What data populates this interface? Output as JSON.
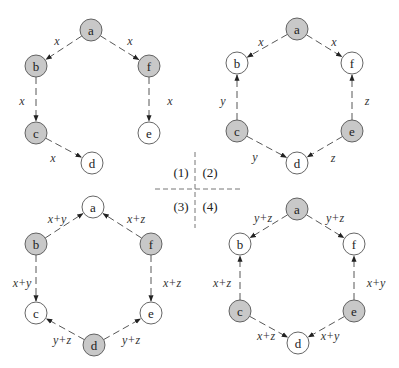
{
  "colors": {
    "shaded_fill": "#c8c8c8",
    "unshaded_fill": "#ffffff",
    "node_stroke": "#555555",
    "edge_stroke": "#444444"
  },
  "divider": {
    "labels": [
      "(1)",
      "(2)",
      "(3)",
      "(4)"
    ]
  },
  "diagrams": [
    {
      "id": "1",
      "nodes": [
        {
          "id": "a",
          "label": "a",
          "x": 91,
          "y": 30,
          "shaded": true
        },
        {
          "id": "b",
          "label": "b",
          "x": 36,
          "y": 66,
          "shaded": true
        },
        {
          "id": "f",
          "label": "f",
          "x": 149,
          "y": 66,
          "shaded": true
        },
        {
          "id": "c",
          "label": "c",
          "x": 36,
          "y": 133,
          "shaded": true
        },
        {
          "id": "e",
          "label": "e",
          "x": 149,
          "y": 133,
          "shaded": false
        },
        {
          "id": "d",
          "label": "d",
          "x": 92,
          "y": 163,
          "shaded": false
        }
      ],
      "edges": [
        {
          "from": "a",
          "to": "b",
          "label": "x",
          "lx": 57,
          "ly": 41
        },
        {
          "from": "a",
          "to": "f",
          "label": "x",
          "lx": 130,
          "ly": 41
        },
        {
          "from": "b",
          "to": "c",
          "label": "x",
          "lx": 22,
          "ly": 101
        },
        {
          "from": "f",
          "to": "e",
          "label": "x",
          "lx": 170,
          "ly": 101
        },
        {
          "from": "c",
          "to": "d",
          "label": "x",
          "lx": 53,
          "ly": 158
        }
      ]
    },
    {
      "id": "2",
      "nodes": [
        {
          "id": "a",
          "label": "a",
          "x": 297,
          "y": 29,
          "shaded": true
        },
        {
          "id": "b",
          "label": "b",
          "x": 237,
          "y": 63,
          "shaded": false
        },
        {
          "id": "f",
          "label": "f",
          "x": 352,
          "y": 63,
          "shaded": false
        },
        {
          "id": "c",
          "label": "c",
          "x": 237,
          "y": 131,
          "shaded": true
        },
        {
          "id": "e",
          "label": "e",
          "x": 352,
          "y": 131,
          "shaded": true
        },
        {
          "id": "d",
          "label": "d",
          "x": 297,
          "y": 163,
          "shaded": false
        }
      ],
      "edges": [
        {
          "from": "a",
          "to": "b",
          "label": "x",
          "lx": 261,
          "ly": 42
        },
        {
          "from": "a",
          "to": "f",
          "label": "x",
          "lx": 334,
          "ly": 42
        },
        {
          "from": "c",
          "to": "b",
          "label": "y",
          "lx": 223,
          "ly": 101
        },
        {
          "from": "e",
          "to": "f",
          "label": "z",
          "lx": 367,
          "ly": 101
        },
        {
          "from": "c",
          "to": "d",
          "label": "y",
          "lx": 255,
          "ly": 157
        },
        {
          "from": "e",
          "to": "d",
          "label": "z",
          "lx": 333,
          "ly": 158
        }
      ]
    },
    {
      "id": "3",
      "nodes": [
        {
          "id": "a",
          "label": "a",
          "x": 93,
          "y": 207,
          "shaded": false
        },
        {
          "id": "b",
          "label": "b",
          "x": 36,
          "y": 244,
          "shaded": true
        },
        {
          "id": "f",
          "label": "f",
          "x": 151,
          "y": 244,
          "shaded": true
        },
        {
          "id": "c",
          "label": "c",
          "x": 36,
          "y": 313,
          "shaded": false
        },
        {
          "id": "e",
          "label": "e",
          "x": 151,
          "y": 313,
          "shaded": false
        },
        {
          "id": "d",
          "label": "d",
          "x": 94,
          "y": 345,
          "shaded": true
        }
      ],
      "edges": [
        {
          "from": "b",
          "to": "a",
          "label": "x+y",
          "lx": 57,
          "ly": 219
        },
        {
          "from": "f",
          "to": "a",
          "label": "x+z",
          "lx": 136,
          "ly": 219
        },
        {
          "from": "b",
          "to": "c",
          "label": "x+y",
          "lx": 22,
          "ly": 283
        },
        {
          "from": "f",
          "to": "e",
          "label": "x+z",
          "lx": 172,
          "ly": 283
        },
        {
          "from": "d",
          "to": "c",
          "label": "y+z",
          "lx": 62,
          "ly": 340
        },
        {
          "from": "d",
          "to": "e",
          "label": "y+z",
          "lx": 131,
          "ly": 340
        }
      ]
    },
    {
      "id": "4",
      "nodes": [
        {
          "id": "a",
          "label": "a",
          "x": 297,
          "y": 209,
          "shaded": true
        },
        {
          "id": "b",
          "label": "b",
          "x": 240,
          "y": 244,
          "shaded": false
        },
        {
          "id": "f",
          "label": "f",
          "x": 354,
          "y": 244,
          "shaded": false
        },
        {
          "id": "c",
          "label": "c",
          "x": 240,
          "y": 311,
          "shaded": true
        },
        {
          "id": "e",
          "label": "e",
          "x": 354,
          "y": 311,
          "shaded": true
        },
        {
          "id": "d",
          "label": "d",
          "x": 298,
          "y": 343,
          "shaded": false
        }
      ],
      "edges": [
        {
          "from": "a",
          "to": "b",
          "label": "y+z",
          "lx": 263,
          "ly": 218
        },
        {
          "from": "a",
          "to": "f",
          "label": "y+z",
          "lx": 335,
          "ly": 218
        },
        {
          "from": "c",
          "to": "b",
          "label": "x+z",
          "lx": 222,
          "ly": 283
        },
        {
          "from": "e",
          "to": "f",
          "label": "x+y",
          "lx": 376,
          "ly": 283
        },
        {
          "from": "c",
          "to": "d",
          "label": "x+z",
          "lx": 266,
          "ly": 336
        },
        {
          "from": "e",
          "to": "d",
          "label": "x+y",
          "lx": 330,
          "ly": 336
        }
      ]
    }
  ]
}
